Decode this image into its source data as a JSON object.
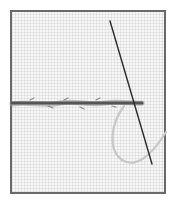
{
  "illustration": {
    "subject": "running stitch with needle",
    "colors": {
      "frame": "#6a6a6a",
      "fabric": "#f7f7f7",
      "stitch_thread": "#595959",
      "loose_thread": "#c8c8c8",
      "needle": "#2a2a2a"
    }
  }
}
